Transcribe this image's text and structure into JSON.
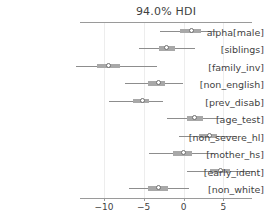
{
  "chart_data": {
    "type": "forest",
    "title": "94.0% HDI",
    "xlabel": "",
    "ylabel": "",
    "xlim": [
      -13.0,
      8.6
    ],
    "xticks": [
      -10,
      -5,
      0,
      5
    ],
    "xtick_labels": [
      "−10",
      "−5",
      "0",
      "5"
    ],
    "grid": true,
    "legend": null,
    "hdi_probability": 0.94,
    "categories": [
      "alpha[male]",
      "[siblings]",
      "[family_inv]",
      "[non_english]",
      "[prev_disab]",
      "[age_test]",
      "[non_severe_hl]",
      "[mother_hs]",
      "[early_ident]",
      "[non_white]"
    ],
    "points": [
      {
        "label": "alpha[male]",
        "value": 1.0,
        "hdi_low": -2.9,
        "hdi_high": 4.1,
        "iqr_low": -0.4,
        "iqr_high": 2.2
      },
      {
        "label": "[siblings]",
        "value": -2.1,
        "hdi_low": -5.6,
        "hdi_high": 1.4,
        "iqr_low": -3.1,
        "iqr_high": -1.1
      },
      {
        "label": "[family_inv]",
        "value": -9.4,
        "hdi_low": -13.5,
        "hdi_high": -3.3,
        "iqr_low": -10.9,
        "iqr_high": -8.0
      },
      {
        "label": "[non_english]",
        "value": -3.1,
        "hdi_low": -7.3,
        "hdi_high": -0.1,
        "iqr_low": -4.4,
        "iqr_high": -2.3
      },
      {
        "label": "[prev_disab]",
        "value": -5.1,
        "hdi_low": -9.3,
        "hdi_high": -2.6,
        "iqr_low": -6.3,
        "iqr_high": -4.3
      },
      {
        "label": "[age_test]",
        "value": 1.4,
        "hdi_low": -2.1,
        "hdi_high": 4.9,
        "iqr_low": 0.4,
        "iqr_high": 2.4
      },
      {
        "label": "[non_severe_hl]",
        "value": 3.3,
        "hdi_low": -0.6,
        "hdi_high": 6.7,
        "iqr_low": 2.0,
        "iqr_high": 4.2
      },
      {
        "label": "[mother_hs]",
        "value": 0.0,
        "hdi_low": -4.3,
        "hdi_high": 3.7,
        "iqr_low": -1.3,
        "iqr_high": 1.1
      },
      {
        "label": "[early_ident]",
        "value": 4.7,
        "hdi_low": 0.4,
        "hdi_high": 9.0,
        "iqr_low": 3.3,
        "iqr_high": 5.9
      },
      {
        "label": "[non_white]",
        "value": -3.2,
        "hdi_low": -6.9,
        "hdi_high": 0.7,
        "iqr_low": -4.4,
        "iqr_high": -2.0
      }
    ]
  },
  "style": {
    "line_color": "#8d8d8d",
    "iqr_color": "#a8a8a8",
    "marker_edge_color": "#6f6f6f",
    "marker_face_color": "#ffffff",
    "grid_color": "#ededed",
    "axis_color": "#9a9a9a",
    "text_color": "#3f3f3f",
    "background": "#ffffff"
  }
}
